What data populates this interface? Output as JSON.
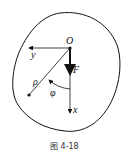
{
  "figure": {
    "caption": "图 4-18",
    "labels": {
      "origin": "O",
      "y_axis": "y",
      "x_axis": "x",
      "force": "F",
      "radius": "ρ",
      "angle": "φ"
    },
    "colors": {
      "stroke": "#111111",
      "background": "#ffffff"
    }
  }
}
